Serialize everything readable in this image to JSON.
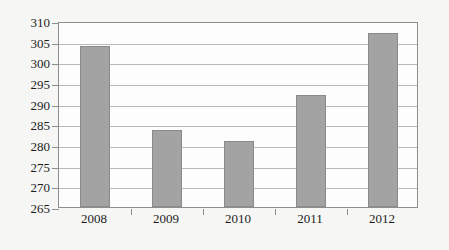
{
  "chart_data": {
    "type": "bar",
    "title": "",
    "subtitle": "",
    "xlabel": "",
    "ylabel": "",
    "categories": [
      "2008",
      "2009",
      "2010",
      "2011",
      "2012"
    ],
    "values": [
      304,
      283.7,
      281,
      292,
      307
    ],
    "series": [
      {
        "name": "",
        "values": [
          304,
          283.7,
          281,
          292,
          307
        ]
      }
    ],
    "ylim": [
      265,
      310
    ],
    "yticks": [
      265,
      270,
      275,
      280,
      285,
      290,
      295,
      300,
      305,
      310
    ],
    "ytick_labels": [
      "265",
      "270",
      "275",
      "280",
      "285",
      "290",
      "295",
      "300",
      "305",
      "310"
    ],
    "grid": true,
    "grid_axis": "y",
    "legend": false,
    "legend_position": "none",
    "bar_color": "#a3a3a3",
    "bar_border_color": "#8a8a8a",
    "plot_background": "#fdfdfd",
    "page_background": "#f6f6f4",
    "gridline_color": "#b9b9b9",
    "axis_color": "#8e8e8e",
    "text_color": "#1c1c1c"
  }
}
